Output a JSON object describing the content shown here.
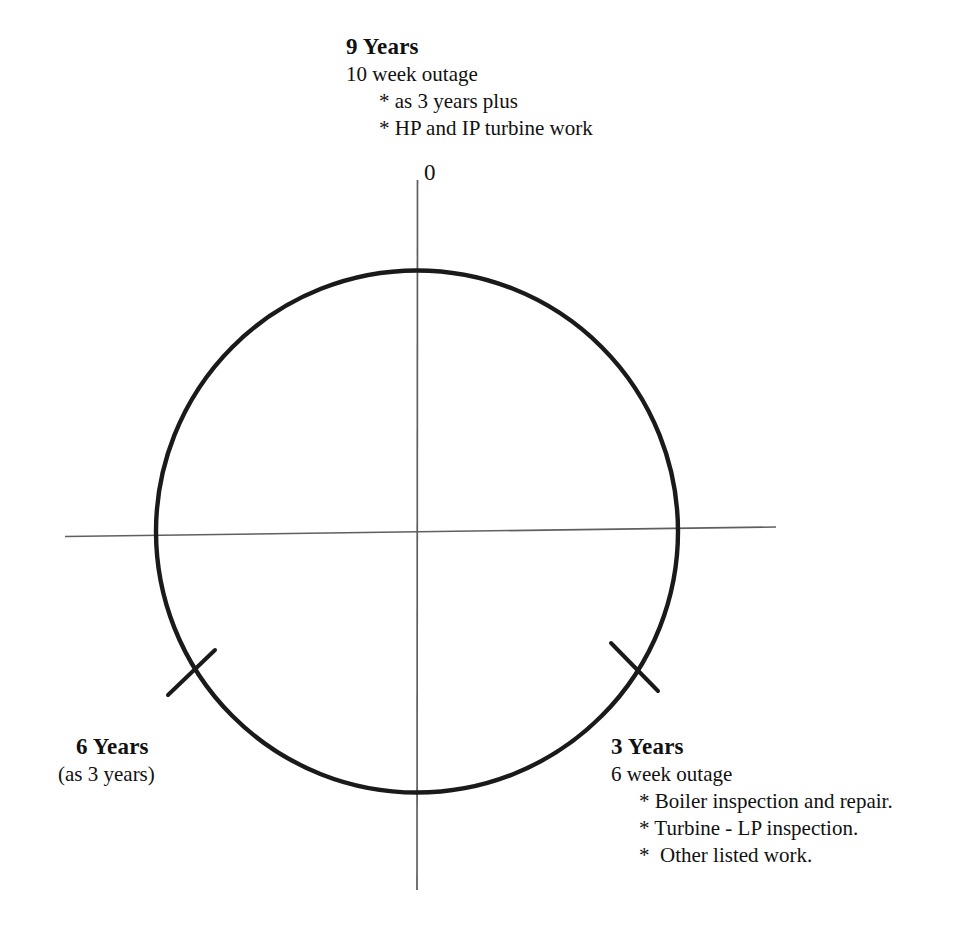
{
  "diagram": {
    "type": "outage-cycle-circle",
    "origin_label": "0",
    "circle": {
      "center_x": 417,
      "center_y": 531,
      "radius": 261,
      "stroke_color": "#1a1a1a"
    },
    "axes": {
      "vertical_color": "#5a5a5a",
      "horizontal_color": "#5a5a5a"
    },
    "tick_marks": [
      {
        "name": "right-tick",
        "x1": 611,
        "y1": 643,
        "x2": 658,
        "y2": 691
      },
      {
        "name": "left-tick",
        "x1": 168,
        "y1": 695,
        "x2": 215,
        "y2": 650
      }
    ]
  },
  "blocks": {
    "nine_years": {
      "heading": "9 Years",
      "subtitle": "10 week outage",
      "bullets": [
        "* as 3 years plus",
        "* HP and IP turbine work"
      ]
    },
    "three_years": {
      "heading": "3 Years",
      "subtitle": "6 week outage",
      "bullets": [
        "* Boiler inspection and repair.",
        "* Turbine - LP inspection.",
        "*  Other listed work."
      ]
    },
    "six_years": {
      "heading": "6 Years",
      "subtitle": "(as 3 years)",
      "bullets": []
    }
  }
}
